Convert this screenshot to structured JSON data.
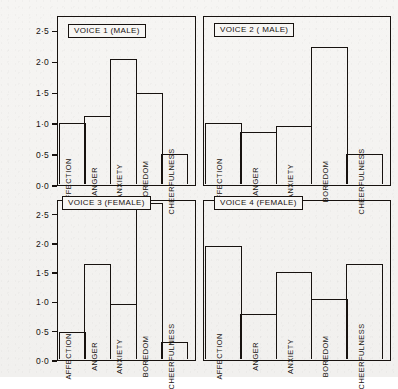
{
  "chart_data": {
    "type": "bar",
    "title": "",
    "xlabel": "",
    "ylabel": "",
    "ylim": [
      0.0,
      2.75
    ],
    "grid": false,
    "legend": "none",
    "categories": [
      "AFFECTION",
      "ANGER",
      "ANXIETY",
      "BOREDOM",
      "CHEERFULNESS"
    ],
    "tick_labels": [
      "0·0",
      "0·5",
      "1·0",
      "1·5",
      "2·0",
      "2·5"
    ],
    "tick_values": [
      0.0,
      0.5,
      1.0,
      1.5,
      2.0,
      2.5
    ],
    "panels": [
      {
        "id": "voice-1",
        "title": "VOICE 1  (MALE)",
        "values": [
          1.0,
          1.12,
          2.05,
          1.5,
          0.5
        ]
      },
      {
        "id": "voice-2",
        "title": "VOICE 2 ( MALE)",
        "values": [
          1.0,
          0.85,
          0.95,
          2.25,
          0.5
        ]
      },
      {
        "id": "voice-3",
        "title": "VOICE 3 (FEMALE)",
        "values": [
          0.48,
          1.65,
          0.95,
          2.7,
          0.3
        ]
      },
      {
        "id": "voice-4",
        "title": "VOICE 4 (FEMALE)",
        "values": [
          1.95,
          0.78,
          1.5,
          1.05,
          1.65
        ]
      }
    ],
    "series": [
      {
        "name": "VOICE 1  (MALE)",
        "values": [
          1.0,
          1.12,
          2.05,
          1.5,
          0.5
        ]
      },
      {
        "name": "VOICE 2 ( MALE)",
        "values": [
          1.0,
          0.85,
          0.95,
          2.25,
          0.5
        ]
      },
      {
        "name": "VOICE 3 (FEMALE)",
        "values": [
          0.48,
          1.65,
          0.95,
          2.7,
          0.3
        ]
      },
      {
        "name": "VOICE 4 (FEMALE)",
        "values": [
          1.95,
          0.78,
          1.5,
          1.05,
          1.65
        ]
      }
    ],
    "colors": {
      "ink": "#17120f",
      "paper": "#f4f3f1"
    }
  }
}
